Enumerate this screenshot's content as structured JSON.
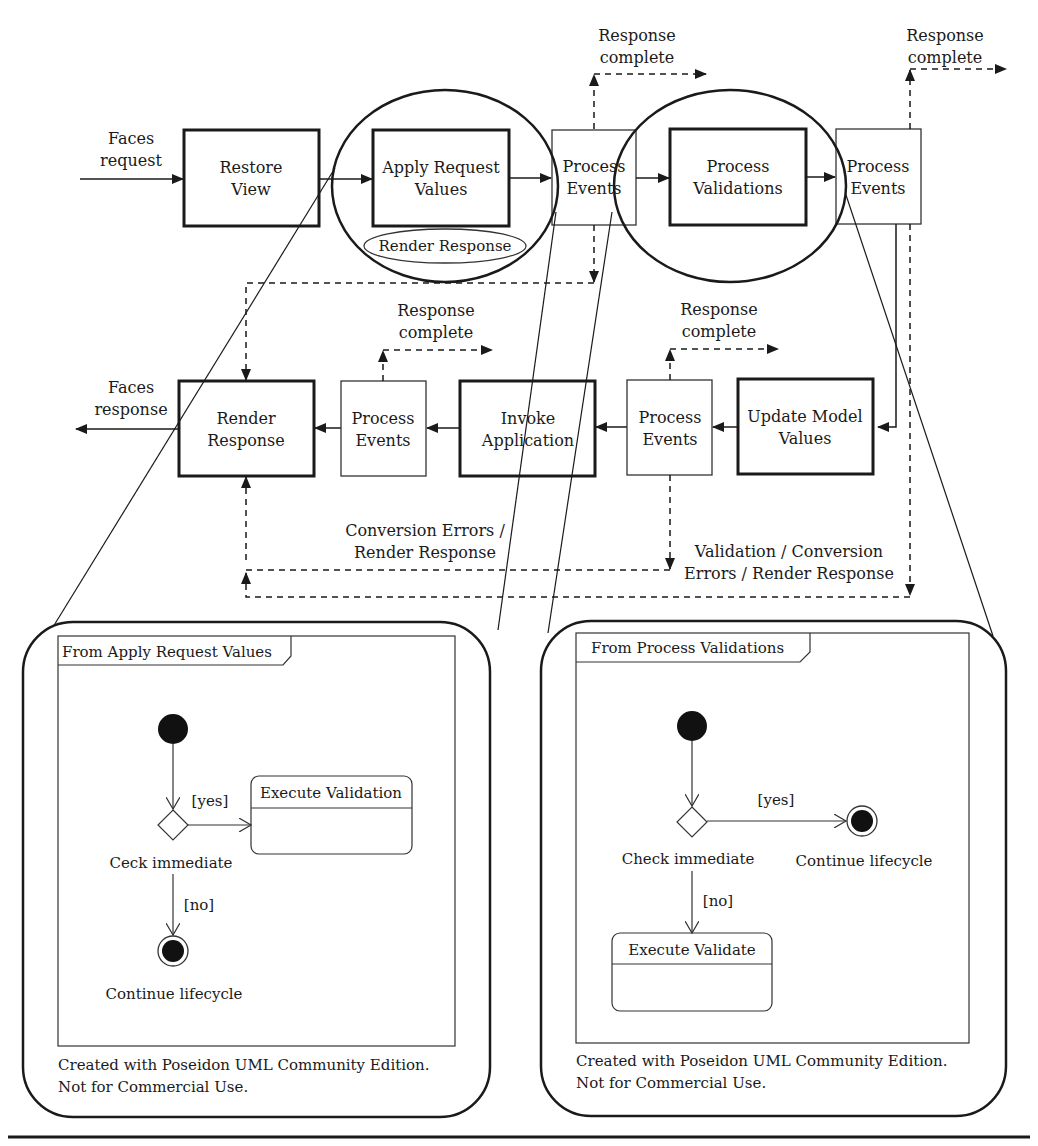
{
  "diagram": {
    "top_row": {
      "faces_request": [
        "Faces",
        "request"
      ],
      "restore_view": [
        "Restore",
        "View"
      ],
      "apply_request_values": [
        "Apply Request",
        "Values"
      ],
      "render_response_oval": "Render Response",
      "process_events_1": [
        "Process",
        "Events"
      ],
      "process_validations": [
        "Process",
        "Validations"
      ],
      "process_events_2": [
        "Process",
        "Events"
      ],
      "response_complete_1": [
        "Response",
        "complete"
      ],
      "response_complete_2": [
        "Response",
        "complete"
      ]
    },
    "middle_row": {
      "faces_response": [
        "Faces",
        "response"
      ],
      "render_response": [
        "Render",
        "Response"
      ],
      "process_events_3": [
        "Process",
        "Events"
      ],
      "invoke_application": [
        "Invoke",
        "Application"
      ],
      "process_events_4": [
        "Process",
        "Events"
      ],
      "update_model_values": [
        "Update Model",
        "Values"
      ],
      "response_complete_3": [
        "Response",
        "complete"
      ],
      "response_complete_4": [
        "Response",
        "complete"
      ],
      "conversion_errors": [
        "Conversion Errors /",
        "Render Response"
      ],
      "validation_errors": [
        "Validation / Conversion",
        "Errors / Render Response"
      ]
    },
    "left_panel": {
      "frame_title": "From Apply Request Values",
      "yes_label": "[yes]",
      "no_label": "[no]",
      "decision_label": "Ceck immediate",
      "state_label": "Execute Validation",
      "final_label": "Continue lifecycle",
      "footer": [
        "Created with Poseidon UML Community Edition.",
        "Not for Commercial Use."
      ]
    },
    "right_panel": {
      "frame_title": "From Process Validations",
      "yes_label": "[yes]",
      "no_label": "[no]",
      "decision_label": "Check immediate",
      "state_label": "Execute Validate",
      "final_label": "Continue lifecycle",
      "footer": [
        "Created with Poseidon UML Community Edition.",
        "Not for Commercial Use."
      ]
    }
  }
}
